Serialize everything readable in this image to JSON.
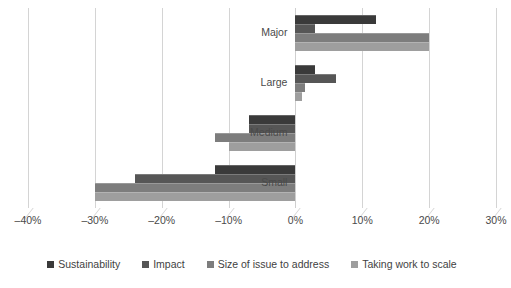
{
  "chart_data": {
    "type": "bar",
    "orientation": "horizontal",
    "title": "",
    "xlabel": "",
    "ylabel": "",
    "categories": [
      "Major",
      "Large",
      "Medium",
      "Small"
    ],
    "series": [
      {
        "name": "Sustainability",
        "color": "#3a3a3a",
        "values": [
          12.0,
          3.0,
          -7.0,
          -12.0
        ]
      },
      {
        "name": "Impact",
        "color": "#565656",
        "values": [
          3.0,
          6.0,
          -7.0,
          -24.0
        ]
      },
      {
        "name": "Size of issue to address",
        "color": "#7d7d7d",
        "values": [
          20.0,
          1.5,
          -12.0,
          -30.0
        ]
      },
      {
        "name": "Taking work to scale",
        "color": "#9e9e9e",
        "values": [
          20.0,
          1.0,
          -10.0,
          -30.0
        ]
      }
    ],
    "xlim": [
      -40,
      30
    ],
    "xticks": [
      -40,
      -30,
      -20,
      -10,
      0,
      10,
      20,
      30
    ],
    "xtick_labels": [
      "–40%",
      "–30%",
      "–20%",
      "–10%",
      "0%",
      "10%",
      "20%",
      "30%"
    ],
    "grid": true,
    "legend_position": "bottom",
    "value_suffix": "%"
  },
  "legend": {
    "items": [
      {
        "label": "Sustainability"
      },
      {
        "label": "Impact"
      },
      {
        "label": "Size of issue to address"
      },
      {
        "label": "Taking work to scale"
      }
    ]
  }
}
